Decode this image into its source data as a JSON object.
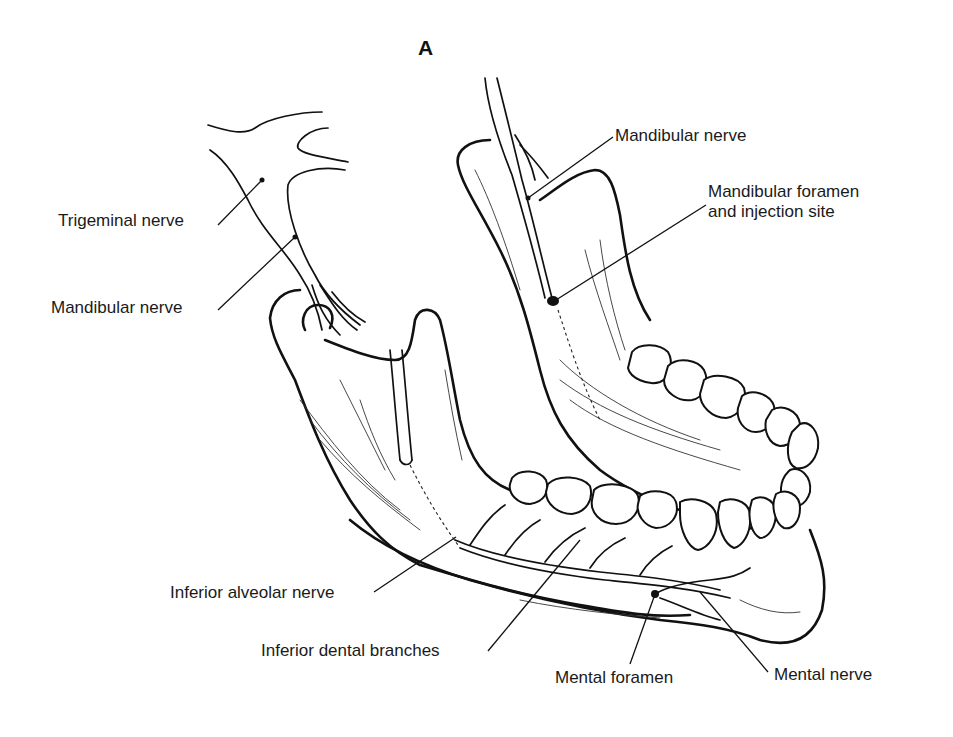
{
  "figure": {
    "panel_label": "A"
  },
  "labels": {
    "trigeminal_nerve": "Trigeminal nerve",
    "mandibular_nerve_left": "Mandibular nerve",
    "mandibular_nerve_right": "Mandibular nerve",
    "mandibular_foramen_line1": "Mandibular foramen",
    "mandibular_foramen_line2": "and injection site",
    "inferior_alveolar_nerve": "Inferior alveolar nerve",
    "inferior_dental_branches": "Inferior dental branches",
    "mental_foramen": "Mental foramen",
    "mental_nerve": "Mental nerve"
  },
  "colors": {
    "background": "#ffffff",
    "ink": "#111111"
  }
}
